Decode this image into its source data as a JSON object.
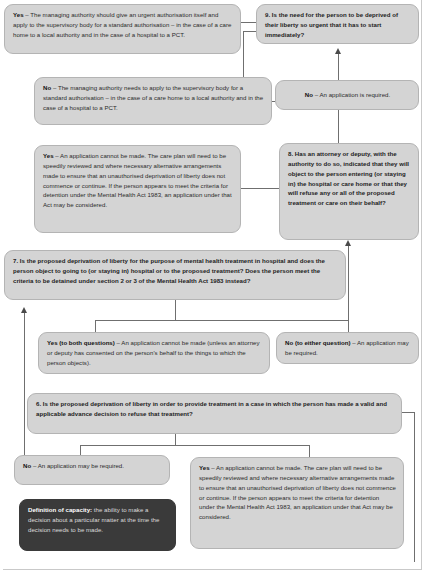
{
  "nodes": {
    "q9": {
      "id": "q9",
      "number": "9.",
      "type": "question",
      "text": "9. Is the need for the person to be deprived of their liberty so urgent that it has to start immediately?"
    },
    "q9_yes": {
      "id": "q9_yes",
      "type": "outcome",
      "lead": "Yes",
      "text": " – The managing authority should give an urgent authorisation itself and apply to the supervisory body for a standard authorisation – in the case of a care home to a local authority and in the case of a hospital to a PCT."
    },
    "q9_no": {
      "id": "q9_no",
      "type": "outcome",
      "lead": "No",
      "text": " – The managing authority needs to apply to the supervisory body for a standard authorisation – in the case of a care home to a local authority and in the case of a hospital to a PCT."
    },
    "q8_no": {
      "id": "q8_no",
      "type": "outcome",
      "lead": "No",
      "text": " – An application is required."
    },
    "q8": {
      "id": "q8",
      "number": "8.",
      "type": "question",
      "text": "8. Has an attorney or deputy, with the authority to do so, indicated that they will object to the person entering (or staying in) the hospital or care home or that they will refuse any or all of the proposed treatment or care on their behalf?"
    },
    "q8_yes": {
      "id": "q8_yes",
      "type": "outcome",
      "lead": "Yes",
      "text": " – An application cannot be made. The care plan will need to be speedily reviewed and where necessary alternative arrangements made to ensure that an unauthorised deprivation of liberty does not commence or continue. If the person appears to meet the criteria for detention under the Mental Health Act 1983, an application under that Act may be considered."
    },
    "q7": {
      "id": "q7",
      "number": "7.",
      "type": "question",
      "text": "7. Is the proposed deprivation of liberty for the purpose of mental health treatment in hospital and does the person object to going to (or staying in) hospital or to the proposed treatment? Does the person meet the criteria to be detained under section 2 or 3 of the Mental Health Act 1983 instead?"
    },
    "q7_yes": {
      "id": "q7_yes",
      "type": "outcome",
      "lead": "Yes (to both questions)",
      "text": " – An application cannot be made (unless an attorney or deputy has consented on the person's behalf to the things to which the person objects)."
    },
    "q7_no": {
      "id": "q7_no",
      "type": "outcome",
      "lead": "No (to either question)",
      "text": " – An application may be required."
    },
    "q6": {
      "id": "q6",
      "number": "6.",
      "type": "question",
      "text": "6. Is the proposed deprivation of liberty in order to provide treatment in a case in which the person has made a valid and applicable advance decision to refuse that treatment?"
    },
    "q6_no": {
      "id": "q6_no",
      "type": "outcome",
      "lead": "No",
      "text": " – An application may be required."
    },
    "q6_yes": {
      "id": "q6_yes",
      "type": "outcome",
      "lead": "Yes",
      "text": " – An application cannot be made. The care plan will need to be speedily reviewed and where necessary alternative arrangements made to ensure that an unauthorised deprivation of liberty does not commence or continue. If the person appears to meet the criteria for detention under the Mental Health Act 1983, an application under that Act may be considered."
    },
    "definition": {
      "id": "definition",
      "type": "definition",
      "lead": "Definition of capacity:",
      "text": " the ability to make a decision about a particular matter at the time the decision needs to be made."
    }
  },
  "colors": {
    "box_fill": "#d4d4d4",
    "box_border": "#b4b4b4",
    "definition_fill": "#3a3a3a",
    "definition_text": "#dddddd",
    "connector": "#6f6f6f",
    "arrow": "#4a4a4a",
    "page_background": "#ffffff"
  },
  "flow": {
    "direction": "bottom-to-top",
    "edges": [
      {
        "from": "q6",
        "to": "q6_no",
        "label": "No"
      },
      {
        "from": "q6",
        "to": "q6_yes",
        "label": "Yes"
      },
      {
        "from": "q6_no",
        "to": "q7",
        "label": ""
      },
      {
        "from": "q7",
        "to": "q7_yes",
        "label": "Yes (to both questions)"
      },
      {
        "from": "q7",
        "to": "q7_no",
        "label": "No (to either question)"
      },
      {
        "from": "q7_no",
        "to": "q8",
        "label": ""
      },
      {
        "from": "q8",
        "to": "q8_yes",
        "label": "Yes"
      },
      {
        "from": "q8",
        "to": "q8_no",
        "label": "No"
      },
      {
        "from": "q8_no",
        "to": "q9",
        "label": ""
      },
      {
        "from": "q9",
        "to": "q9_yes",
        "label": "Yes"
      },
      {
        "from": "q9",
        "to": "q9_no",
        "label": "No"
      }
    ]
  }
}
